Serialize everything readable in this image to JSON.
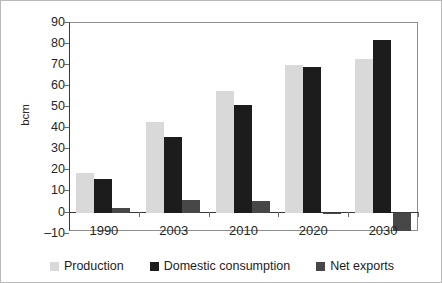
{
  "chart_data": {
    "type": "bar",
    "title": "",
    "subtitle": "",
    "xlabel": "",
    "ylabel": "bcm",
    "ylim": [
      -10,
      90
    ],
    "yticks": [
      90,
      80,
      70,
      60,
      50,
      40,
      30,
      20,
      10,
      0,
      -10
    ],
    "ytick_labels": [
      "90",
      "80",
      "70",
      "60",
      "50",
      "40",
      "30",
      "20",
      "10",
      "0",
      "–10"
    ],
    "grid": false,
    "legend_position": "bottom",
    "categories": [
      "1990",
      "2003",
      "2010",
      "2020",
      "2030"
    ],
    "series": [
      {
        "name": "Production",
        "color": "#d9d9d9",
        "values": [
          19,
          43,
          58,
          70.5,
          73
        ]
      },
      {
        "name": "Domestic consumption",
        "color": "#1c1c1c",
        "values": [
          16,
          36,
          51.5,
          69.5,
          82
        ]
      },
      {
        "name": "Net exports",
        "color": "#474747",
        "values": [
          2.5,
          6,
          5.5,
          -0.5,
          -8.5
        ]
      }
    ]
  },
  "axis": {
    "y_title": "bcm"
  },
  "legend": {
    "items": [
      {
        "label": "Production",
        "color": "#d9d9d9"
      },
      {
        "label": "Domestic consumption",
        "color": "#1c1c1c"
      },
      {
        "label": "Net exports",
        "color": "#474747"
      }
    ]
  }
}
